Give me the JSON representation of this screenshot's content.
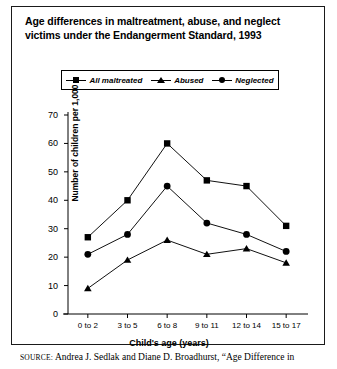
{
  "figure": {
    "title": "Age differences in maltreatment, abuse, and neglect victims under the Endangerment Standard, 1993",
    "source_keyword": "SOURCE:",
    "source_text": " Andrea J. Sedlak and Diane D. Broadhurst, “Age Difference in"
  },
  "chart_data": {
    "type": "line",
    "title": "Age differences in maltreatment, abuse, and neglect victims under the Endangerment Standard, 1993",
    "xlabel": "Child's age (years)",
    "ylabel": "Number of children per 1,000",
    "categories": [
      "0 to 2",
      "3 to 5",
      "6 to 8",
      "9 to 11",
      "12 to 14",
      "15 to 17"
    ],
    "ylim": [
      0,
      70
    ],
    "yticks": [
      0,
      10,
      20,
      30,
      40,
      50,
      60,
      70
    ],
    "grid": false,
    "legend_position": "top",
    "series": [
      {
        "name": "All maltreated",
        "marker": "square",
        "values": [
          27,
          40,
          60,
          47,
          45,
          31
        ]
      },
      {
        "name": "Abused",
        "marker": "triangle",
        "values": [
          9,
          19,
          26,
          21,
          23,
          18
        ]
      },
      {
        "name": "Neglected",
        "marker": "circle",
        "values": [
          21,
          28,
          45,
          32,
          28,
          22
        ]
      }
    ]
  }
}
